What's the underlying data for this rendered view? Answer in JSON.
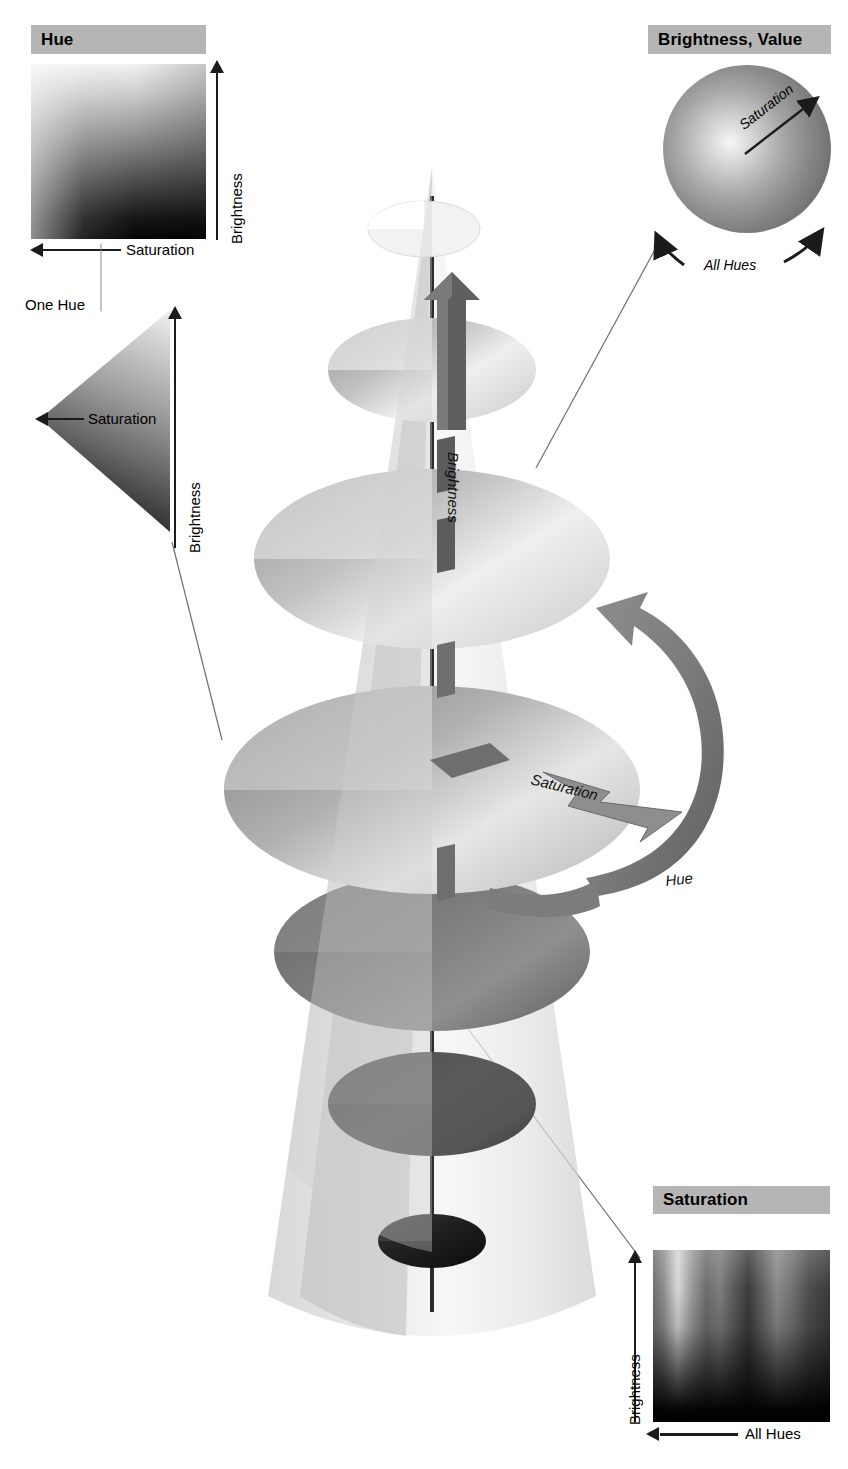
{
  "figure": {
    "background_color": "#ffffff",
    "header_box_color": "#b5b5b5",
    "text_color": "#000000"
  },
  "panels": {
    "hue": {
      "header": "Hue",
      "y_axis_label": "Brightness",
      "x_axis_label": "Saturation",
      "caption": "One Hue",
      "triangle": {
        "saturation_label": "Saturation",
        "brightness_label": "Brightness"
      }
    },
    "brightness_value": {
      "header": "Brightness, Value",
      "radial_label": "Saturation",
      "arc_label": "All Hues"
    },
    "saturation": {
      "header": "Saturation",
      "y_axis_label": "Brightness",
      "x_axis_label": "All Hues"
    }
  },
  "cone": {
    "axis_label": "Brightness",
    "radial_label": "Saturation",
    "circular_label": "Hue"
  },
  "icons": {
    "arrow_up": "arrow-up-icon",
    "arrow_left": "arrow-left-icon",
    "arrow_curved": "curved-arrow-icon",
    "arrow_diagonal": "diagonal-arrow-icon"
  }
}
